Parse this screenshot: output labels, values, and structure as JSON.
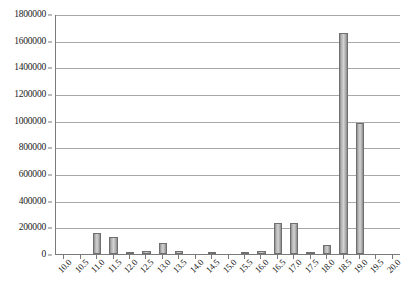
{
  "chart_data": {
    "type": "bar",
    "title": "",
    "subtitle": "",
    "xlabel": "",
    "ylabel": "",
    "legend": [],
    "legend_position": "none",
    "grid": true,
    "ylim": [
      0,
      1800000
    ],
    "ytick_step": 200000,
    "ytick_labels": [
      "0",
      "200000",
      "400000",
      "600000",
      "800000",
      "1000000",
      "1200000",
      "1400000",
      "1600000",
      "1800000"
    ],
    "ytick_values": [
      0,
      200000,
      400000,
      600000,
      800000,
      1000000,
      1200000,
      1400000,
      1600000,
      1800000
    ],
    "categories": [
      "10.0",
      "10.5",
      "11.0",
      "11.5",
      "12.0",
      "12.5",
      "13.0",
      "13.5",
      "14.0",
      "14.5",
      "15.0",
      "15.5",
      "16.0",
      "16.5",
      "17.0",
      "17.5",
      "18.0",
      "18.5",
      "19.0",
      "19.5",
      "20.0"
    ],
    "values": [
      0,
      0,
      155000,
      125000,
      9000,
      20000,
      82000,
      22000,
      0,
      11000,
      0,
      5000,
      19000,
      230000,
      235000,
      8000,
      65000,
      1655000,
      980000,
      0,
      0
    ],
    "bar_fill_start": "#8e8e8e",
    "bar_fill_mid": "#d2d2d2",
    "bar_fill_end": "#8a8a8a",
    "bar_border": "#6f6f6f",
    "gridline_color": "#a8a8a8",
    "axis_color": "#7a7a7a",
    "background": "#ffffff",
    "text_color": "#1a1a1a"
  }
}
